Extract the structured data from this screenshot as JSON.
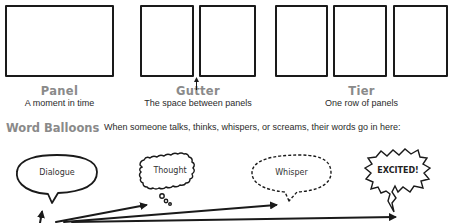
{
  "concepts": [
    {
      "term": "Panel",
      "description": "A moment in time"
    },
    {
      "term": "Gutter",
      "description": "The space between panels"
    },
    {
      "term": "Tier",
      "description": "One row of panels"
    }
  ],
  "word_balloons": {
    "title": "Word Balloons",
    "description": "When someone talks, thinks, whispers, or screams, their words go in here:",
    "balloons": [
      {
        "label": "Dialogue",
        "style": "smooth-oval"
      },
      {
        "label": "Thought",
        "style": "cloud"
      },
      {
        "label": "Whisper",
        "style": "dashed"
      },
      {
        "label": "EXCITED!",
        "style": "jagged"
      }
    ]
  },
  "colors": {
    "line": "#1a1a1a",
    "heading": "#8a8a8a",
    "text": "#2a2a2a",
    "background": "#ffffff"
  }
}
